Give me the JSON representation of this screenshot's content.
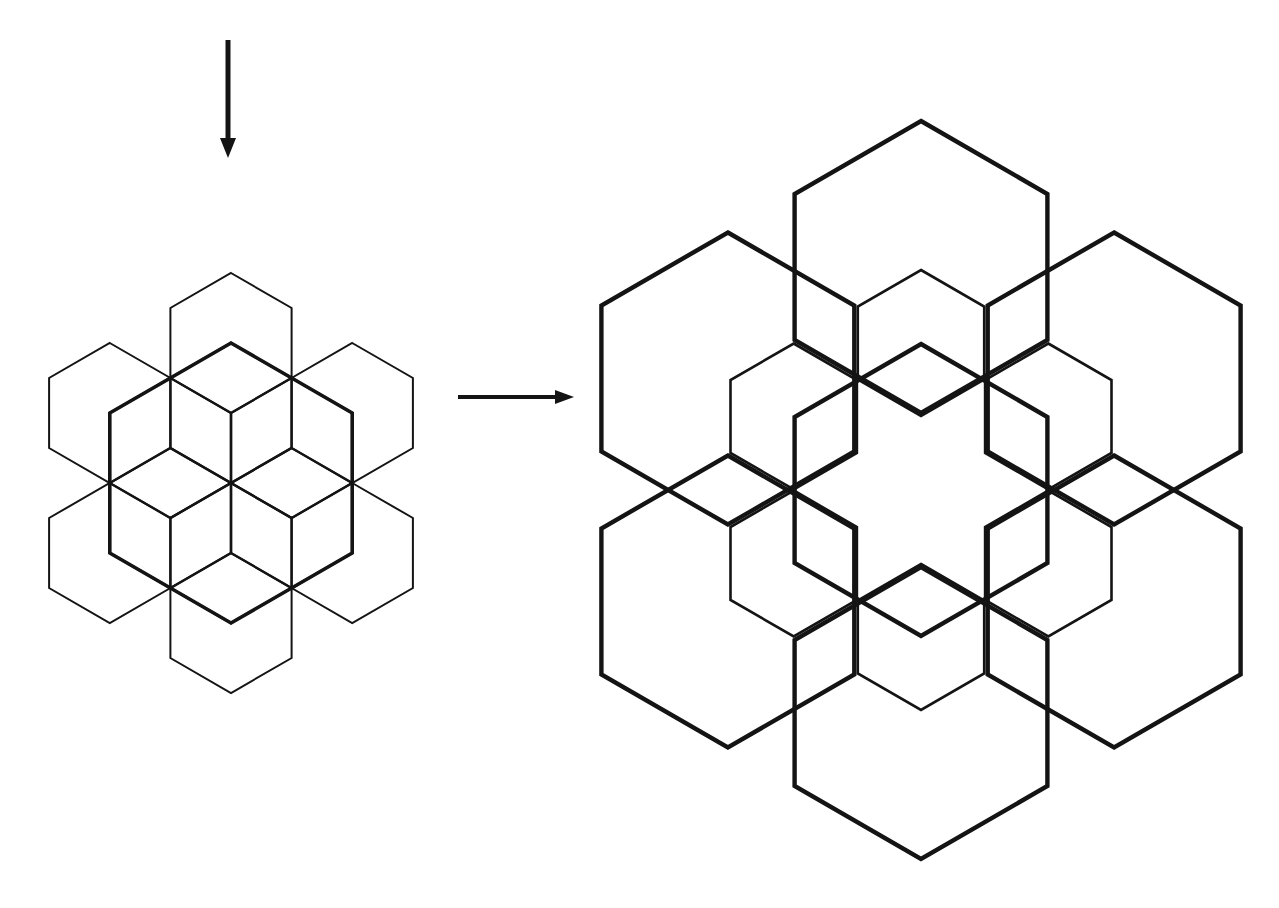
{
  "diagram": {
    "stroke_color": "#141414",
    "background": "#ffffff",
    "arrows": [
      {
        "name": "down-arrow-icon",
        "x1": 228,
        "y1": 40,
        "x2": 228,
        "y2": 158,
        "head_length": 20,
        "head_width": 16,
        "width": 5
      },
      {
        "name": "right-arrow-icon",
        "x1": 458,
        "y1": 397,
        "x2": 574,
        "y2": 397,
        "head_length": 19,
        "head_width": 14,
        "width": 4
      }
    ],
    "figures": [
      {
        "name": "source-hex-pattern",
        "center": [
          231,
          483
        ],
        "groups": [
          {
            "name": "outer-thin-ring",
            "side": 70,
            "radius": 140,
            "start_angle": 30,
            "count": 6,
            "stroke_width": 2
          },
          {
            "name": "inner-hex-ring",
            "side": 70,
            "radius": 70,
            "start_angle": 30,
            "count": 6,
            "stroke_width": 2.4
          },
          {
            "name": "central-thick-hex",
            "side": 140,
            "radius": 0,
            "start_angle": 0,
            "count": 1,
            "stroke_width": 3.6
          }
        ]
      },
      {
        "name": "expanded-hex-rosette",
        "center": [
          921,
          490
        ],
        "groups": [
          {
            "name": "inner-thin-ring",
            "side": 73,
            "radius": 147,
            "start_angle": 30,
            "count": 6,
            "stroke_width": 2.6
          },
          {
            "name": "central-thick-hex",
            "side": 146,
            "radius": 0,
            "start_angle": 0,
            "count": 1,
            "stroke_width": 4.4
          },
          {
            "name": "outer-big-ring",
            "side": 146,
            "radius": 223,
            "start_angle": 30,
            "count": 6,
            "stroke_width": 4.4
          }
        ]
      }
    ]
  }
}
